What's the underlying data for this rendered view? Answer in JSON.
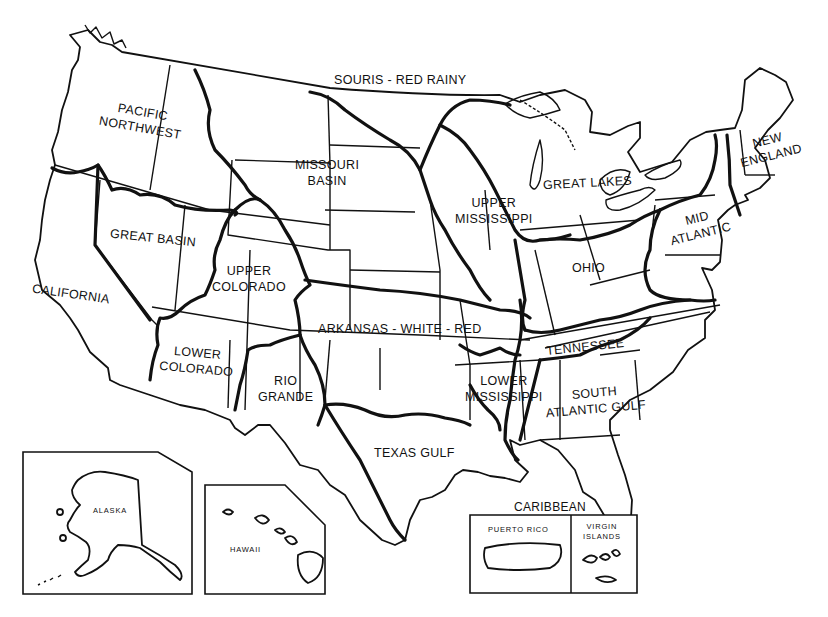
{
  "map": {
    "title": "Water Resource Regions of the United States",
    "style": {
      "ink": "#111111",
      "background": "#ffffff"
    },
    "regions": [
      {
        "id": "souris-red-rainy",
        "label": "SOURIS - RED RAINY"
      },
      {
        "id": "pacific-northwest",
        "label_line1": "PACIFIC",
        "label_line2": "NORTHWEST"
      },
      {
        "id": "missouri-basin",
        "label_line1": "MISSOURI",
        "label_line2": "BASIN"
      },
      {
        "id": "great-basin",
        "label": "GREAT BASIN"
      },
      {
        "id": "california",
        "label": "CALIFORNIA"
      },
      {
        "id": "upper-colorado",
        "label_line1": "UPPER",
        "label_line2": "COLORADO"
      },
      {
        "id": "lower-colorado",
        "label_line1": "LOWER",
        "label_line2": "COLORADO"
      },
      {
        "id": "rio-grande",
        "label_line1": "RIO",
        "label_line2": "GRANDE"
      },
      {
        "id": "arkansas-white-red",
        "label": "ARKANSAS - WHITE - RED"
      },
      {
        "id": "texas-gulf",
        "label": "TEXAS GULF"
      },
      {
        "id": "upper-mississippi",
        "label_line1": "UPPER",
        "label_line2": "MISSISSIPPI"
      },
      {
        "id": "lower-mississippi",
        "label_line1": "LOWER",
        "label_line2": "MISSISSIPPI"
      },
      {
        "id": "great-lakes",
        "label": "GREAT LAKES"
      },
      {
        "id": "ohio",
        "label": "OHIO"
      },
      {
        "id": "tennessee",
        "label": "TENNESSEE"
      },
      {
        "id": "south-atlantic-gulf",
        "label_line1": "SOUTH",
        "label_line2": "ATLANTIC GULF"
      },
      {
        "id": "mid-atlantic",
        "label_line1": "MID",
        "label_line2": "ATLANTIC"
      },
      {
        "id": "new-england",
        "label_line1": "NEW",
        "label_line2": "ENGLAND"
      }
    ],
    "insets": {
      "alaska": {
        "label": "ALASKA"
      },
      "hawaii": {
        "label": "HAWAII"
      },
      "caribbean": {
        "title": "CARIBBEAN",
        "puerto_rico": "PUERTO RICO",
        "virgin_islands_line1": "VIRGIN",
        "virgin_islands_line2": "ISLANDS"
      }
    }
  }
}
